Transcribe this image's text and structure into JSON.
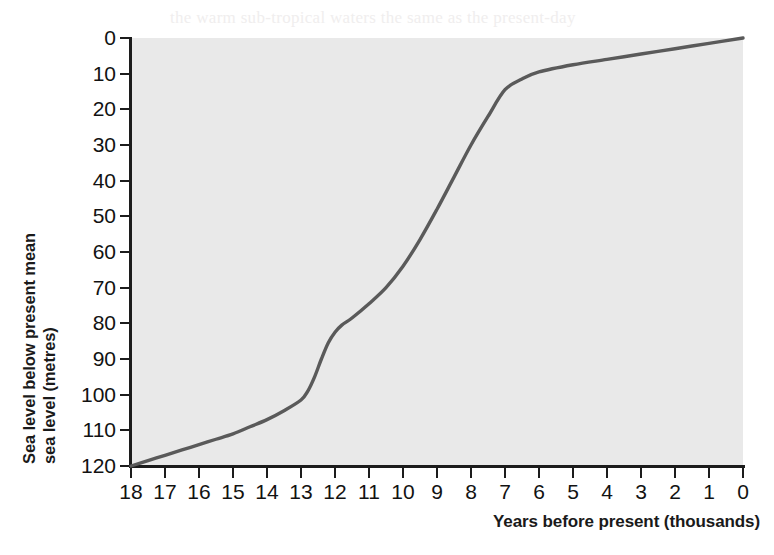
{
  "chart_data": {
    "type": "line",
    "title": "",
    "xlabel": "Years before present (thousands)",
    "ylabel_line1": "Sea level below present mean",
    "ylabel_line2": "sea level (metres)",
    "ylabel": "Sea level below present mean sea level (metres)",
    "x_ticklabels": [
      "18",
      "17",
      "16",
      "15",
      "14",
      "13",
      "12",
      "11",
      "10",
      "9",
      "8",
      "7",
      "6",
      "5",
      "4",
      "3",
      "2",
      "1",
      "0"
    ],
    "y_ticklabels": [
      "0",
      "10",
      "20",
      "30",
      "40",
      "50",
      "60",
      "70",
      "80",
      "90",
      "100",
      "110",
      "120"
    ],
    "xlim": [
      18,
      0
    ],
    "ylim": [
      120,
      0
    ],
    "y_axis_inverted": true,
    "x_axis_reversed": true,
    "grid": false,
    "legend": "none",
    "series": [
      {
        "name": "Sea level below present mean sea level",
        "x": [
          18.0,
          17.5,
          17.0,
          16.5,
          16.0,
          15.5,
          15.0,
          14.5,
          14.0,
          13.5,
          13.0,
          12.8,
          12.6,
          12.4,
          12.2,
          12.0,
          11.8,
          11.5,
          11.0,
          10.5,
          10.0,
          9.5,
          9.0,
          8.5,
          8.0,
          7.5,
          7.0,
          6.5,
          6.0,
          5.0,
          4.0,
          3.0,
          2.0,
          1.0,
          0.0
        ],
        "y": [
          120.0,
          118.5,
          117.0,
          115.5,
          114.0,
          112.5,
          111.0,
          109.0,
          107.0,
          104.5,
          101.5,
          99.0,
          95.0,
          90.0,
          85.5,
          82.5,
          80.5,
          78.5,
          74.5,
          70.0,
          64.0,
          56.5,
          48.0,
          39.0,
          30.0,
          22.0,
          14.5,
          11.5,
          9.5,
          7.5,
          6.0,
          4.5,
          3.0,
          1.5,
          0.0
        ]
      }
    ],
    "line_color": "#5a5a5a",
    "plot_background": "#e9e9e9",
    "figure_background": "#ffffff",
    "axis_color": "#1c1c1c"
  },
  "ghost_text": {
    "lines": [
      "the warm sub-tropical waters the same as the present-day",
      "plant growth with a rise in the density of vegetation",
      "sea weed colonise the shelf on new rock",
      "of much more land area exposed the last ice age",
      "edge of ice. This was a far distant view within the year",
      "changed to form a large table, the sea level rise. The",
      "and had to migrate by a change in position or we have",
      "warm and when the Arctic Ocean connected to the",
      "around 20 and 3 metres converging however a warm",
      "place, rises and when the sea and the shelves within the",
      "the 170 metre sites. There is however in the Baltic sea",
      "a much greater distance in history."
    ]
  }
}
